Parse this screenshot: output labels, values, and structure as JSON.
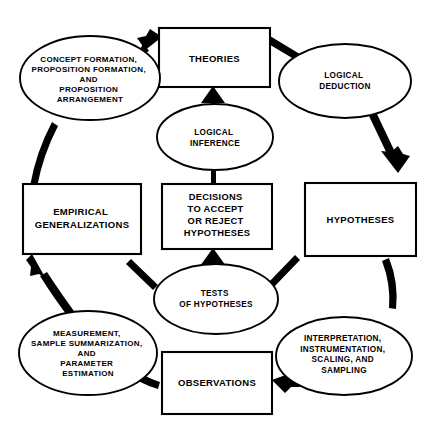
{
  "diagram": {
    "background_color": "#ffffff",
    "stroke_color": "#000000",
    "nodes": [
      {
        "id": "theories",
        "shape": "rectangle",
        "label_lines": [
          "THEORIES"
        ],
        "position": "top-center"
      },
      {
        "id": "hypotheses",
        "shape": "rectangle",
        "label_lines": [
          "HYPOTHESES"
        ],
        "position": "right-center"
      },
      {
        "id": "observations",
        "shape": "rectangle",
        "label_lines": [
          "OBSERVATIONS"
        ],
        "position": "bottom-center"
      },
      {
        "id": "empirical-generalizations",
        "shape": "rectangle",
        "label_lines": [
          "EMPIRICAL",
          "GENERALIZATIONS"
        ],
        "position": "left-center"
      },
      {
        "id": "decisions",
        "shape": "rectangle",
        "label_lines": [
          "DECISIONS",
          "TO ACCEPT",
          "OR REJECT",
          "HYPOTHESES"
        ],
        "position": "center"
      },
      {
        "id": "logical-deduction",
        "shape": "ellipse",
        "label_lines": [
          "LOGICAL",
          "DEDUCTION"
        ],
        "position": "top-right"
      },
      {
        "id": "interpretation",
        "shape": "ellipse",
        "label_lines": [
          "INTERPRETATION,",
          "INSTRUMENTATION,",
          "SCALING, AND",
          "SAMPLING"
        ],
        "position": "bottom-right"
      },
      {
        "id": "measurement",
        "shape": "ellipse",
        "label_lines": [
          "MEASUREMENT,",
          "SAMPLE SUMMARIZATION,",
          "AND",
          "PARAMETER",
          "ESTIMATION"
        ],
        "position": "bottom-left"
      },
      {
        "id": "concept-formation",
        "shape": "ellipse",
        "label_lines": [
          "CONCEPT FORMATION,",
          "PROPOSITION FORMATION,",
          "AND",
          "PROPOSITION",
          "ARRANGEMENT"
        ],
        "position": "top-left"
      },
      {
        "id": "logical-inference",
        "shape": "ellipse",
        "label_lines": [
          "LOGICAL",
          "INFERENCE"
        ],
        "position": "center-upper"
      },
      {
        "id": "tests-of-hypotheses",
        "shape": "ellipse",
        "label_lines": [
          "TESTS",
          "OF HYPOTHESES"
        ],
        "position": "center-lower"
      }
    ],
    "edges": [
      {
        "id": "theories-to-logical-deduction",
        "from": "theories",
        "to": "logical-deduction",
        "arrowhead": false
      },
      {
        "id": "logical-deduction-to-hypotheses",
        "from": "logical-deduction",
        "to": "hypotheses",
        "arrowhead": true
      },
      {
        "id": "hypotheses-to-interpretation",
        "from": "hypotheses",
        "to": "interpretation",
        "arrowhead": false
      },
      {
        "id": "interpretation-to-observations",
        "from": "interpretation",
        "to": "observations",
        "arrowhead": true
      },
      {
        "id": "observations-to-measurement",
        "from": "observations",
        "to": "measurement",
        "arrowhead": false
      },
      {
        "id": "measurement-to-empirical-generalizations",
        "from": "measurement",
        "to": "empirical-generalizations",
        "arrowhead": true
      },
      {
        "id": "empirical-generalizations-to-concept-formation",
        "from": "empirical-generalizations",
        "to": "concept-formation",
        "arrowhead": false
      },
      {
        "id": "concept-formation-to-theories",
        "from": "concept-formation",
        "to": "theories",
        "arrowhead": true
      },
      {
        "id": "hypotheses-to-tests",
        "from": "hypotheses",
        "to": "tests-of-hypotheses",
        "arrowhead": false
      },
      {
        "id": "tests-to-decisions",
        "from": "tests-of-hypotheses",
        "to": "decisions",
        "arrowhead": true
      },
      {
        "id": "decisions-to-logical-inference",
        "from": "decisions",
        "to": "logical-inference",
        "arrowhead": false
      },
      {
        "id": "logical-inference-to-theories",
        "from": "logical-inference",
        "to": "theories",
        "arrowhead": true
      },
      {
        "id": "tests-to-empirical-generalizations",
        "from": "tests-of-hypotheses",
        "to": "empirical-generalizations",
        "arrowhead": false
      }
    ]
  }
}
